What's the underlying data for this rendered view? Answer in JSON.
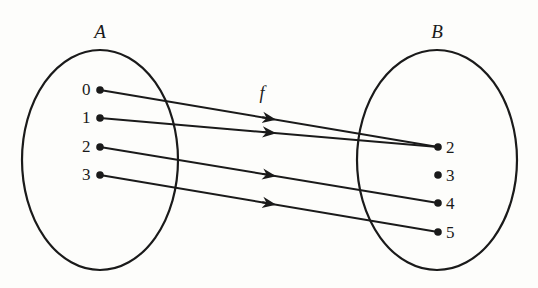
{
  "diagram": {
    "sets": [
      {
        "name": "A",
        "cx": 100,
        "cy": 160,
        "rx": 78,
        "ry": 110,
        "label_x": 100,
        "label_y": 22,
        "elements": [
          {
            "label": "0",
            "x": 100,
            "y": 90
          },
          {
            "label": "1",
            "x": 100,
            "y": 118
          },
          {
            "label": "2",
            "x": 100,
            "y": 147
          },
          {
            "label": "3",
            "x": 100,
            "y": 175
          }
        ]
      },
      {
        "name": "B",
        "cx": 437,
        "cy": 160,
        "rx": 80,
        "ry": 110,
        "label_x": 437,
        "label_y": 22,
        "elements": [
          {
            "label": "2",
            "x": 438,
            "y": 147
          },
          {
            "label": "3",
            "x": 438,
            "y": 175
          },
          {
            "label": "4",
            "x": 438,
            "y": 203
          },
          {
            "label": "5",
            "x": 438,
            "y": 232
          }
        ]
      }
    ],
    "function": {
      "name": "f",
      "label_x": 262,
      "label_y": 84
    },
    "mappings": [
      {
        "from": "0",
        "to": "2"
      },
      {
        "from": "1",
        "to": "2"
      },
      {
        "from": "2",
        "to": "4"
      },
      {
        "from": "3",
        "to": "5"
      }
    ],
    "stroke_color": "#1a1a1a"
  }
}
